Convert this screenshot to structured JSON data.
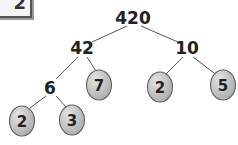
{
  "label": {
    "text": "2"
  },
  "tree": {
    "root": {
      "value": "420",
      "x": 133,
      "y": 18
    },
    "nodes": [
      {
        "value": "42",
        "x": 82,
        "y": 48
      },
      {
        "value": "10",
        "x": 187,
        "y": 48
      },
      {
        "value": "6",
        "x": 50,
        "y": 88
      }
    ],
    "leaves": [
      {
        "value": "7",
        "x": 99,
        "y": 85
      },
      {
        "value": "2",
        "x": 160,
        "y": 87
      },
      {
        "value": "5",
        "x": 223,
        "y": 85
      },
      {
        "value": "2",
        "x": 22,
        "y": 121
      },
      {
        "value": "3",
        "x": 72,
        "y": 120
      }
    ]
  }
}
